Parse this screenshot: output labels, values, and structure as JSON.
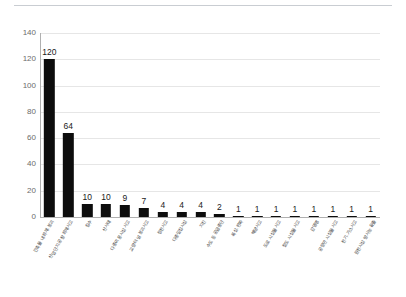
{
  "chart_data": {
    "type": "bar",
    "title": "",
    "xlabel": "",
    "ylabel": "",
    "ylim": [
      0,
      140
    ],
    "ytick_step": 20,
    "yticks": [
      0,
      20,
      40,
      60,
      80,
      100,
      120,
      140
    ],
    "ytick_labels": [
      "0",
      "20",
      "40",
      "60",
      "80",
      "100",
      "120",
      "140"
    ],
    "grid": true,
    "legend": false,
    "bar_color": "#0d0d0d",
    "grid_color": "#e6e6e6",
    "categories": [
      "건축물 내 화재·붕괴",
      "산업단지·공장 화재사고",
      "침수",
      "산사태",
      "다중이용시설 사고",
      "교량·터널 붕괴사고",
      "정전사고",
      "다중밀집시설",
      "지진",
      "수도 등 공급중단",
      "폭설·한파",
      "해양사고",
      "도로 시설물 사고",
      "철도 시설물 사고",
      "감염병",
      "공항만 시설물 사고",
      "전기·가스사고",
      "원전시설 방사능 유출"
    ],
    "values": [
      120,
      64,
      10,
      10,
      9,
      7,
      4,
      4,
      4,
      2,
      1,
      1,
      1,
      1,
      1,
      1,
      1,
      1
    ],
    "value_labels": [
      "120",
      "64",
      "10",
      "10",
      "9",
      "7",
      "4",
      "4",
      "4",
      "2",
      "1",
      "1",
      "1",
      "1",
      "1",
      "1",
      "1",
      "1"
    ]
  }
}
